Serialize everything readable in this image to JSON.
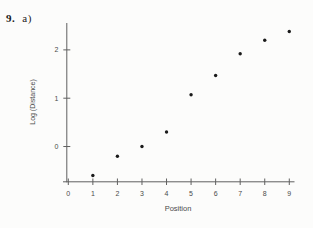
{
  "page": {
    "problem_number": "9.",
    "part_label": "a)"
  },
  "chart_data": {
    "type": "scatter",
    "title": "",
    "xlabel": "Position",
    "ylabel": "Log (Distance)",
    "x": [
      1,
      2,
      3,
      4,
      5,
      6,
      7,
      8,
      9
    ],
    "y": [
      -0.6,
      -0.2,
      0.0,
      0.3,
      1.07,
      1.47,
      1.92,
      2.2,
      2.38
    ],
    "x_ticks": [
      0,
      1,
      2,
      3,
      4,
      5,
      6,
      7,
      8,
      9
    ],
    "y_ticks": [
      0,
      1,
      2
    ],
    "xlim": [
      -0.2,
      9.2
    ],
    "ylim": [
      -0.73,
      2.55
    ],
    "grid": false,
    "legend": "none",
    "marker": "filled-dot",
    "colors": {
      "point": "#1a1a1a",
      "axis": "#606060",
      "tick_label": "#4f4f4f",
      "axis_label": "#4a4a4a",
      "background": "#fcfcfb"
    }
  }
}
